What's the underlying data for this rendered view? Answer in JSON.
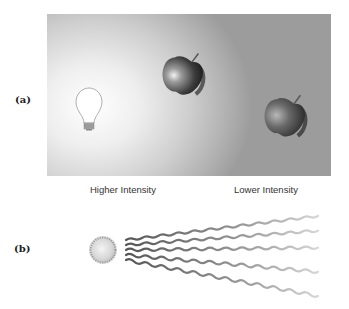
{
  "panels": {
    "a": {
      "label": "(a)",
      "icons": [
        "light-bulb-icon",
        "apple-icon-near",
        "apple-icon-far"
      ]
    },
    "b": {
      "label": "(b)",
      "captions": {
        "higher": "Higher Intensity",
        "lower": "Lower Intensity"
      },
      "icons": [
        "light-source-icon"
      ],
      "rays": 5
    }
  },
  "colors": {
    "panel_bright": "#ffffff",
    "panel_dark": "#9c9c9c",
    "wave_start": "#555555",
    "wave_end": "#cccccc"
  }
}
